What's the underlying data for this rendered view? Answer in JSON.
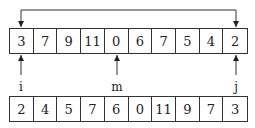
{
  "top_array": {
    "values": [
      "3",
      "7",
      "9",
      "11",
      "0",
      "6",
      "7",
      "5",
      "4",
      "2"
    ]
  },
  "bottom_array": {
    "values": [
      "2",
      "4",
      "5",
      "7",
      "6",
      "0",
      "11",
      "9",
      "7",
      "3"
    ]
  },
  "pointers": {
    "i": "i",
    "m": "m",
    "j": "j"
  },
  "swap_arrow": {
    "from_index": 0,
    "to_index": 9
  }
}
